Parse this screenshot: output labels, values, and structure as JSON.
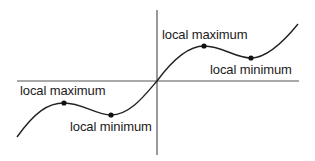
{
  "diagram": {
    "type": "function-graph",
    "colors": {
      "line": "#222222",
      "axis": "#555555",
      "background": "#ffffff"
    },
    "axes": {
      "origin": [
        157,
        81
      ],
      "x_axis": {
        "from": [
          17,
          81
        ],
        "to": [
          299,
          81
        ]
      },
      "y_axis": {
        "from": [
          157,
          10
        ],
        "to": [
          157,
          155
        ]
      }
    },
    "labels": [
      {
        "id": "left-max",
        "text": "local maximum",
        "x": 20,
        "y": 84
      },
      {
        "id": "left-min",
        "text": "local minimum",
        "x": 70,
        "y": 120
      },
      {
        "id": "right-max",
        "text": "local maximum",
        "x": 162,
        "y": 28
      },
      {
        "id": "right-min",
        "text": "local minimum",
        "x": 210,
        "y": 63
      }
    ],
    "points": [
      {
        "id": "left-max-point",
        "kind": "local maximum",
        "x": 64,
        "y": 103
      },
      {
        "id": "left-min-point",
        "kind": "local minimum",
        "x": 111,
        "y": 115
      },
      {
        "id": "right-max-point",
        "kind": "local maximum",
        "x": 204,
        "y": 46
      },
      {
        "id": "right-min-point",
        "kind": "local minimum",
        "x": 251,
        "y": 58
      }
    ]
  }
}
